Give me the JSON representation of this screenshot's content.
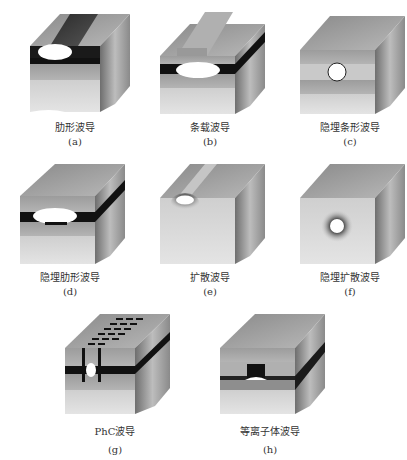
{
  "figure": {
    "panels": [
      {
        "id": "a",
        "caption": "肋形波导",
        "label": "(a)",
        "type": "rib-waveguide"
      },
      {
        "id": "b",
        "caption": "条载波导",
        "label": "(b)",
        "type": "strip-loaded-waveguide"
      },
      {
        "id": "c",
        "caption": "隐埋条形波导",
        "label": "(c)",
        "type": "buried-strip-waveguide"
      },
      {
        "id": "d",
        "caption": "隐埋肋形波导",
        "label": "(d)",
        "type": "buried-rib-waveguide"
      },
      {
        "id": "e",
        "caption": "扩散波导",
        "label": "(e)",
        "type": "diffused-waveguide"
      },
      {
        "id": "f",
        "caption": "隐埋扩散波导",
        "label": "(f)",
        "type": "buried-diffused-waveguide"
      },
      {
        "id": "g",
        "caption": "PhC波导",
        "label": "(g)",
        "type": "photonic-crystal-waveguide"
      },
      {
        "id": "h",
        "caption": "等离子体波导",
        "label": "(h)",
        "type": "plasmonic-waveguide"
      }
    ],
    "colors": {
      "core_layer": "#111111",
      "mode_spot": "#ffffff",
      "front_light": "#d6d6d6",
      "front_mid": "#a8a8a8",
      "top_face": "#9a9a9a",
      "side_face": "#8c8c8c"
    }
  }
}
